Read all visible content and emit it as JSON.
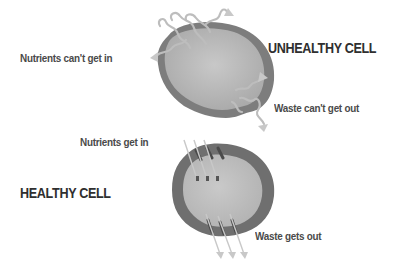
{
  "unhealthy": {
    "title": "UNHEALTHY CELL",
    "label_in": "Nutrients can't get in",
    "label_out": "Waste can't get out"
  },
  "healthy": {
    "title": "HEALTHY CELL",
    "label_in": "Nutrients get in",
    "label_out": "Waste gets out"
  },
  "colors": {
    "membrane": "#7a7a7a",
    "cytoplasm": "#b9b9b9",
    "arrow": "#c4c4c4",
    "text": "#4a4a4a",
    "title": "#2f2f2f"
  }
}
